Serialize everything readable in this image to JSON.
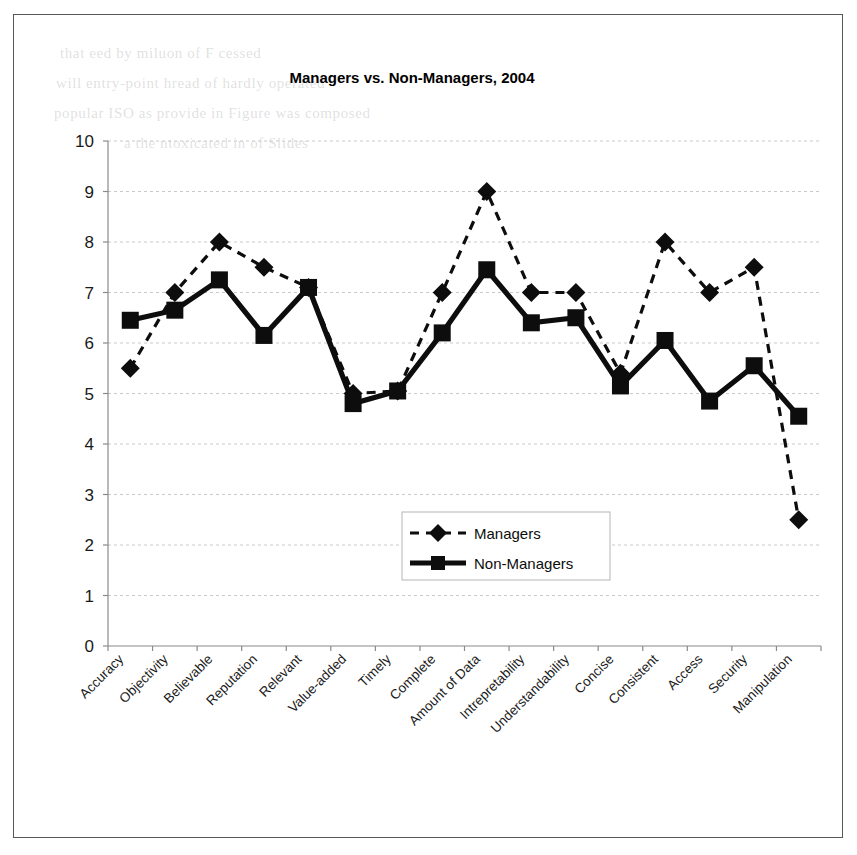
{
  "figure": {
    "border_color": "#58585a",
    "background": "#ffffff"
  },
  "chart_data": {
    "type": "line",
    "title": "Managers vs. Non-Managers, 2004",
    "xlabel": "",
    "ylabel": "",
    "ylim": [
      0,
      10
    ],
    "ytick_step": 1,
    "ytick_labels": [
      "10",
      "9",
      "8",
      "7",
      "6",
      "5",
      "4",
      "3",
      "2",
      "1",
      "0"
    ],
    "grid": true,
    "legend_position": "center",
    "categories": [
      "Accuracy",
      "Objectivity",
      "Believable",
      "Reputation",
      "Relevant",
      "Value-added",
      "Timely",
      "Complete",
      "Amount of Data",
      "Intrepretability",
      "Understandability",
      "Concise",
      "Consistent",
      "Access",
      "Security",
      "Manipulation"
    ],
    "series": [
      {
        "name": "Managers",
        "marker": "diamond",
        "linestyle": "dashed",
        "color": "#0d0d0d",
        "values": [
          5.5,
          7.0,
          8.0,
          7.5,
          7.1,
          5.0,
          5.05,
          7.0,
          9.0,
          7.0,
          7.0,
          5.4,
          8.0,
          7.0,
          7.5,
          2.5
        ]
      },
      {
        "name": "Non-Managers",
        "marker": "square",
        "linestyle": "solid",
        "color": "#0d0d0d",
        "values": [
          6.45,
          6.65,
          7.25,
          6.15,
          7.1,
          4.8,
          5.05,
          6.2,
          7.45,
          6.4,
          6.5,
          5.15,
          6.05,
          4.85,
          5.55,
          4.55
        ]
      }
    ]
  },
  "legend": {
    "entries": [
      {
        "label": "Managers",
        "marker": "diamond",
        "linestyle": "dashed"
      },
      {
        "label": "Non-Managers",
        "marker": "square",
        "linestyle": "solid"
      }
    ]
  },
  "page_background_text": {
    "lines": [
      "that       eed by miluon of  F     cessed",
      "will entry-point  hread   of  hardly  operated",
      "popular  ISO  as  provide   in   Figure  was  composed",
      "a    the    ntoxicated  in    of  Slides"
    ]
  }
}
